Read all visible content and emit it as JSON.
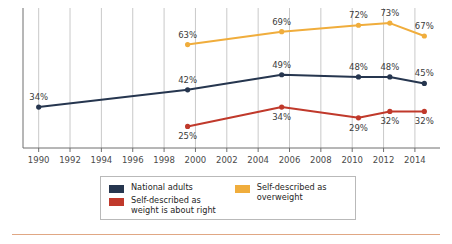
{
  "chart_data": {
    "type": "line",
    "title": "",
    "xlabel": "",
    "ylabel": "",
    "xlim": [
      1989,
      2015.6
    ],
    "ylim": [
      15,
      80
    ],
    "grid": "vertical gridlines at each even-year tick",
    "legend_position": "bottom-center",
    "x_ticks": [
      1990,
      1992,
      1994,
      1996,
      1998,
      2000,
      2002,
      2004,
      2006,
      2008,
      2010,
      2012,
      2014
    ],
    "tick_labels": [
      "1990",
      "1992",
      "1994",
      "1996",
      "1998",
      "2000",
      "2002",
      "2004",
      "2006",
      "2008",
      "2010",
      "2012",
      "2014"
    ],
    "series": [
      {
        "name": "National adults",
        "color": "#26364f",
        "x": [
          1990,
          1999.5,
          2005.5,
          2010.4,
          2012.4,
          2014.6
        ],
        "values": [
          34,
          42,
          49,
          48,
          48,
          45
        ],
        "labels": [
          "34%",
          "42%",
          "49%",
          "48%",
          "48%",
          "45%"
        ],
        "label_positions": [
          "above",
          "above",
          "above",
          "above",
          "above",
          "above"
        ]
      },
      {
        "name": "Self-described as weight is about right",
        "color": "#c0392b",
        "x": [
          1999.5,
          2005.5,
          2010.4,
          2012.4,
          2014.6
        ],
        "values": [
          25,
          34,
          29,
          32,
          32
        ],
        "labels": [
          "25%",
          "34%",
          "29%",
          "32%",
          "32%"
        ],
        "label_positions": [
          "below",
          "below",
          "below",
          "below",
          "below"
        ]
      },
      {
        "name": "Self-described as overweight",
        "color": "#f0ad3c",
        "x": [
          1999.5,
          2005.5,
          2010.4,
          2012.4,
          2014.6
        ],
        "values": [
          63,
          69,
          72,
          73,
          67
        ],
        "labels": [
          "63%",
          "69%",
          "72%",
          "73%",
          "67%"
        ],
        "label_positions": [
          "above",
          "above",
          "above",
          "above",
          "above"
        ]
      }
    ]
  },
  "legend": {
    "entries": [
      {
        "label": "National adults",
        "color": "#26364f",
        "column": "left"
      },
      {
        "label": "Self-described as\nweight is about right",
        "color": "#c0392b",
        "column": "left"
      },
      {
        "label": "Self-described as\noverweight",
        "color": "#f0ad3c",
        "column": "right"
      }
    ]
  },
  "colors": {
    "national_adults": "#26364f",
    "about_right": "#c0392b",
    "overweight": "#f0ad3c",
    "gridline": "#c9c9c9",
    "axis": "#6f6f6f",
    "bottom_rule": "#e0a784"
  }
}
